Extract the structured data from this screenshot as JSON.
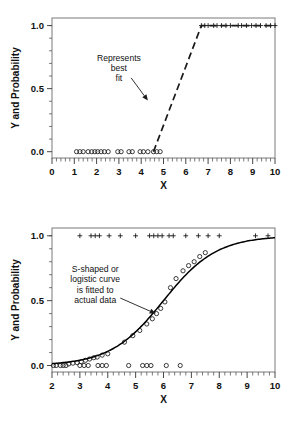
{
  "figure": {
    "background_color": "#ffffff",
    "marker_color": "#1a1a1a",
    "frame_color": "#7a7a7a"
  },
  "chart_data": [
    {
      "id": "top",
      "type": "scatter",
      "title": "",
      "subtitle": "",
      "xlabel": "X",
      "ylabel": "Y and Probability",
      "xlim": [
        0,
        10
      ],
      "ylim": [
        -0.05,
        1.06
      ],
      "grid": false,
      "legend_position": "none",
      "xticks": [
        0,
        1,
        2,
        3,
        4,
        5,
        6,
        7,
        8,
        9,
        10
      ],
      "xtick_labels": [
        "0",
        "1",
        "2",
        "3",
        "4",
        "5",
        "6",
        "7",
        "8",
        "9",
        "10"
      ],
      "xtick_minor_step": 0.2,
      "yticks": [
        0.0,
        0.5,
        1.0
      ],
      "ytick_labels": [
        "0.0",
        "0.5",
        "1.0"
      ],
      "ytick_minor_step": 0.1,
      "annotations": [
        {
          "name": "represents-best-fit",
          "lines": [
            "Represents",
            "best",
            "fit"
          ],
          "text_anchor_x": 3.0,
          "text_anchor_y": 0.72,
          "arrow_from_x": 3.55,
          "arrow_from_y": 0.585,
          "arrow_to_x": 4.3,
          "arrow_to_y": 0.405
        }
      ],
      "series": [
        {
          "name": "observed-zero-outcomes",
          "marker": "circle",
          "x": [
            1.1,
            1.25,
            1.4,
            1.62,
            1.78,
            1.92,
            2.05,
            2.2,
            2.35,
            2.52,
            2.95,
            3.1,
            3.45,
            3.6,
            3.95,
            4.1,
            4.3,
            4.55,
            4.7,
            4.85
          ],
          "y": [
            0,
            0,
            0,
            0,
            0,
            0,
            0,
            0,
            0,
            0,
            0,
            0,
            0,
            0,
            0,
            0,
            0,
            0,
            0,
            0
          ]
        },
        {
          "name": "observed-one-outcomes",
          "marker": "plus",
          "x": [
            6.7,
            6.85,
            7.0,
            7.25,
            7.4,
            7.6,
            7.8,
            8.0,
            8.35,
            8.5,
            8.72,
            8.95,
            9.15,
            9.35,
            9.6,
            9.8,
            10.0
          ],
          "y": [
            1,
            1,
            1,
            1,
            1,
            1,
            1,
            1,
            1,
            1,
            1,
            1,
            1,
            1,
            1,
            1,
            1
          ]
        },
        {
          "name": "best-fit-line",
          "marker": "dashed-line",
          "x": [
            4.55,
            6.7,
            10.0
          ],
          "y": [
            0.0,
            1.0,
            1.0
          ]
        }
      ]
    },
    {
      "id": "bottom",
      "type": "scatter",
      "title": "",
      "subtitle": "",
      "xlabel": "X",
      "ylabel": "Y and Probability",
      "xlim": [
        2,
        10
      ],
      "ylim": [
        -0.05,
        1.06
      ],
      "grid": false,
      "legend_position": "none",
      "xticks": [
        2,
        3,
        4,
        5,
        6,
        7,
        8,
        9,
        10
      ],
      "xtick_labels": [
        "2",
        "3",
        "4",
        "5",
        "6",
        "7",
        "8",
        "9",
        "10"
      ],
      "xtick_minor_step": 0.2,
      "yticks": [
        0.0,
        0.5,
        1.0
      ],
      "ytick_labels": [
        "0.0",
        "0.5",
        "1.0"
      ],
      "ytick_minor_step": 0.1,
      "annotations": [
        {
          "name": "s-shaped-logistic-curve",
          "lines": [
            "S-shaped or",
            "logistic curve",
            "is fitted to",
            "actual data"
          ],
          "text_anchor_x": 3.55,
          "text_anchor_y": 0.72,
          "arrow_from_x": 4.45,
          "arrow_from_y": 0.52,
          "arrow_to_x": 5.72,
          "arrow_to_y": 0.4
        }
      ],
      "series": [
        {
          "name": "observed-zero-outcomes",
          "marker": "circle",
          "x": [
            2.05,
            2.15,
            2.3,
            2.4,
            2.5,
            3.0,
            3.15,
            3.3,
            3.65,
            3.8,
            3.95,
            4.75,
            5.25,
            5.4,
            5.55,
            6.1,
            6.6
          ],
          "y": [
            0,
            0,
            0,
            0,
            0,
            0,
            0,
            0,
            0,
            0,
            0,
            0,
            0,
            0,
            0,
            0,
            0
          ]
        },
        {
          "name": "observed-one-outcomes",
          "marker": "plus",
          "x": [
            3.0,
            3.4,
            3.55,
            3.7,
            4.05,
            4.45,
            5.0,
            5.5,
            5.65,
            5.8,
            5.95,
            6.2,
            6.35,
            6.8,
            7.25,
            7.6,
            8.0,
            9.3,
            9.75
          ],
          "y": [
            1,
            1,
            1,
            1,
            1,
            1,
            1,
            1,
            1,
            1,
            1,
            1,
            1,
            1,
            1,
            1,
            1,
            1,
            1
          ]
        },
        {
          "name": "fitted-probability-points",
          "marker": "circle",
          "x": [
            2.6,
            2.75,
            2.9,
            3.05,
            3.2,
            3.35,
            3.5,
            3.62,
            3.8,
            4.0,
            4.6,
            4.9,
            5.15,
            5.4,
            5.6,
            5.75,
            5.9,
            6.05,
            6.25,
            6.45,
            6.7,
            6.9,
            7.1,
            7.3,
            7.5
          ],
          "y": [
            0.012,
            0.018,
            0.022,
            0.03,
            0.04,
            0.05,
            0.06,
            0.065,
            0.08,
            0.09,
            0.18,
            0.23,
            0.27,
            0.32,
            0.36,
            0.4,
            0.44,
            0.49,
            0.6,
            0.67,
            0.73,
            0.77,
            0.8,
            0.84,
            0.87
          ]
        },
        {
          "name": "logistic-fit-curve",
          "marker": "solid-line",
          "midpoint_x": 6.0,
          "steepness": 1.05
        }
      ]
    }
  ]
}
